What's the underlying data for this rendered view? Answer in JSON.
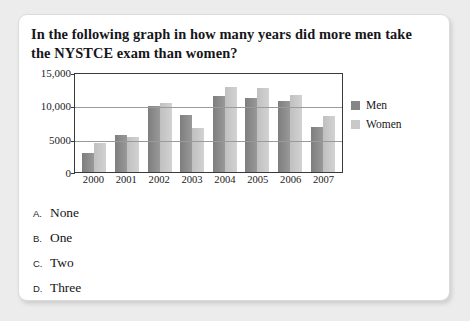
{
  "question": "In the following graph in how many years did more men take the NYSTCE exam than women?",
  "chart_data": {
    "type": "bar",
    "title": "",
    "xlabel": "",
    "ylabel": "",
    "categories": [
      "2000",
      "2001",
      "2002",
      "2003",
      "2004",
      "2005",
      "2006",
      "2007"
    ],
    "series": [
      {
        "name": "Men",
        "color": "#8e8e8e",
        "values": [
          2900,
          5600,
          9850,
          8550,
          11400,
          11150,
          10650,
          6800
        ]
      },
      {
        "name": "Women",
        "color": "#c9c9c9",
        "values": [
          4400,
          5300,
          10350,
          6600,
          12750,
          12650,
          11600,
          8350
        ]
      }
    ],
    "ylim": [
      0,
      15000
    ],
    "yticks": [
      0,
      5000,
      10000,
      15000
    ],
    "ytick_labels": [
      "0",
      "5000",
      "10,000",
      "15,000"
    ],
    "grid": true,
    "legend_position": "right"
  },
  "options": [
    {
      "letter": "A.",
      "text": "None"
    },
    {
      "letter": "B.",
      "text": "One"
    },
    {
      "letter": "C.",
      "text": "Two"
    },
    {
      "letter": "D.",
      "text": "Three"
    }
  ]
}
